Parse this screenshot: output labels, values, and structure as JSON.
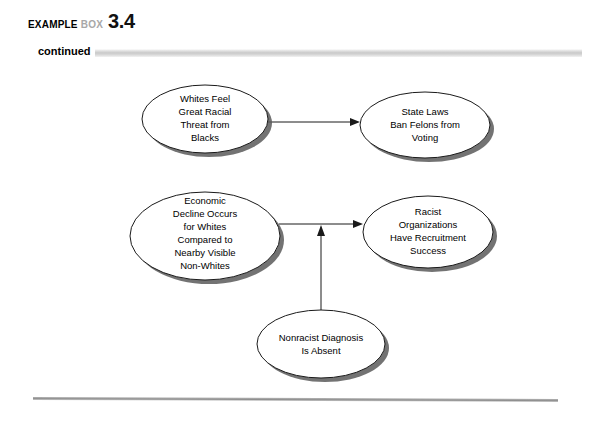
{
  "header": {
    "kicker_example": "EXAMPLE",
    "kicker_box": "BOX",
    "number": "3.4",
    "continued_label": "continued"
  },
  "diagram": {
    "type": "flow-diagram",
    "nodes": [
      {
        "id": "whites-feel-threat",
        "lines": [
          "Whites Feel",
          "Great Racial",
          "Threat from",
          "Blacks"
        ],
        "cx": 205,
        "cy": 55,
        "rx": 63,
        "ry": 34
      },
      {
        "id": "state-laws-ban-felons",
        "lines": [
          "State Laws",
          "Ban Felons from",
          "Voting"
        ],
        "cx": 425,
        "cy": 61,
        "rx": 65,
        "ry": 33
      },
      {
        "id": "economic-decline",
        "lines": [
          "Economic",
          "Decline Occurs",
          "for Whites",
          "Compared to",
          "Nearby Visible",
          "Non-Whites"
        ],
        "cx": 205,
        "cy": 172,
        "rx": 75,
        "ry": 44
      },
      {
        "id": "racist-organizations",
        "lines": [
          "Racist",
          "Organizations",
          "Have Recruitment",
          "Success"
        ],
        "cx": 428,
        "cy": 168,
        "rx": 65,
        "ry": 36
      },
      {
        "id": "nonracist-diagnosis",
        "lines": [
          "Nonracist Diagnosis",
          "Is Absent"
        ],
        "cx": 321,
        "cy": 280,
        "rx": 64,
        "ry": 34
      }
    ],
    "edges": [
      {
        "id": "threat-to-laws",
        "from": "whites-feel-threat",
        "to": "state-laws-ban-felons",
        "orientation": "horizontal"
      },
      {
        "id": "decline-to-organizations",
        "from": "economic-decline",
        "to": "racist-organizations",
        "orientation": "horizontal"
      },
      {
        "id": "diagnosis-to-link",
        "from": "nonracist-diagnosis",
        "to": "decline-to-organizations",
        "orientation": "vertical-up"
      }
    ]
  },
  "colors": {
    "line": "#1a1a1a",
    "shadow": "#5a5a5a",
    "rule": "#8f8f8f",
    "kicker_grey": "#a8a8a8"
  }
}
